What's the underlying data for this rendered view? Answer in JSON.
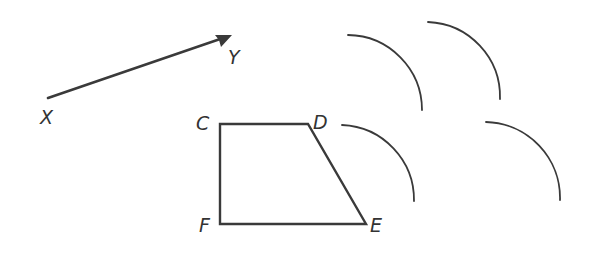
{
  "diagram": {
    "type": "geometry-translation-construction",
    "colors": {
      "line": "#3a3a3a",
      "label": "#333333",
      "background": "#ffffff"
    },
    "vector": {
      "from_label": "X",
      "to_label": "Y",
      "from": [
        48,
        98
      ],
      "to": [
        232,
        35
      ]
    },
    "trapezoid": {
      "vertices": [
        {
          "label": "C",
          "point": [
            220,
            124
          ]
        },
        {
          "label": "D",
          "point": [
            308,
            124
          ]
        },
        {
          "label": "E",
          "point": [
            366,
            224
          ]
        },
        {
          "label": "F",
          "point": [
            220,
            224
          ]
        }
      ]
    },
    "arcs": [
      {
        "name": "arc-1",
        "start": [
          348,
          35
        ],
        "end": [
          422,
          110
        ],
        "radius": 75
      },
      {
        "name": "arc-2",
        "start": [
          428,
          22
        ],
        "end": [
          500,
          99
        ],
        "radius": 75
      },
      {
        "name": "arc-3",
        "start": [
          342,
          125
        ],
        "end": [
          414,
          201
        ],
        "radius": 75
      },
      {
        "name": "arc-4",
        "start": [
          486,
          122
        ],
        "end": [
          560,
          200
        ],
        "radius": 76
      }
    ],
    "labels": {
      "X": "X",
      "Y": "Y",
      "C": "C",
      "D": "D",
      "E": "E",
      "F": "F"
    }
  }
}
